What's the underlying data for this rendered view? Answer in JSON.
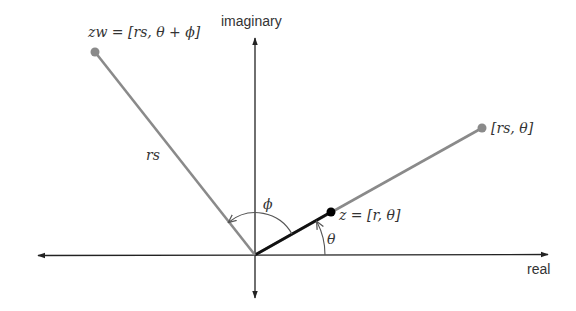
{
  "diagram": {
    "axes": {
      "real_label": "real",
      "imaginary_label": "imaginary"
    },
    "points": {
      "z": {
        "label": "z = [r, θ]",
        "color": "#000000"
      },
      "rs_theta": {
        "label": "[rs, θ]",
        "color": "#8a8a8a"
      },
      "zw": {
        "label": "zw = [rs, θ + ϕ]",
        "color": "#8a8a8a"
      }
    },
    "segment_labels": {
      "rs": "rs"
    },
    "angles": {
      "theta": "θ",
      "phi": "ϕ"
    },
    "colors": {
      "axis": "#222222",
      "gray_line": "#8a8a8a",
      "black_line": "#111111",
      "arc": "#555555",
      "text": "#333333"
    }
  }
}
